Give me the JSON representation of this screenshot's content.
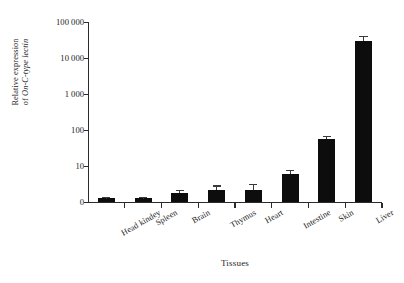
{
  "chart_data": {
    "type": "bar",
    "title": "",
    "xlabel": "Tissues",
    "ylabel_line1": "Relative expression",
    "ylabel_line2_prefix": "of ",
    "ylabel_line2_italic": "On-C-type lectin",
    "categories": [
      "Head kindey",
      "Spleen",
      "Brain",
      "Thymus",
      "Heart",
      "Intestine",
      "Skin",
      "Liver"
    ],
    "values": [
      1.0,
      1.0,
      1.8,
      2.2,
      2.2,
      6.0,
      55.0,
      30000.0
    ],
    "errors": [
      0.35,
      0.4,
      0.4,
      0.7,
      0.9,
      1.6,
      14.0,
      11000.0
    ],
    "yscale": "log",
    "ytick_labels": [
      "0",
      "10",
      "100",
      "1 000",
      "10 000",
      "100 000"
    ],
    "ytick_values": [
      0,
      10,
      100,
      1000,
      10000,
      100000
    ],
    "ylim": [
      0,
      100000
    ],
    "grid": false,
    "legend": "none",
    "bar_color": "#0d0d0d",
    "axis_color": "#2b2b2b",
    "background": "#ffffff"
  }
}
